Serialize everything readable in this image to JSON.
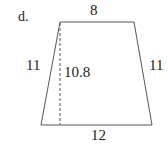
{
  "problem_label": "d.",
  "shape": "trapezoid",
  "labels": {
    "top_base": "8",
    "bottom_base": "12",
    "left_side": "11",
    "right_side": "11",
    "height": "10.8"
  },
  "colors": {
    "stroke": "#555555",
    "text": "#222222"
  }
}
